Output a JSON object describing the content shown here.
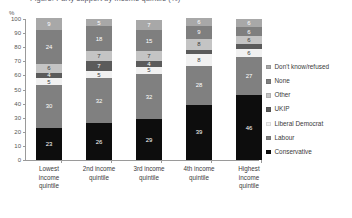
{
  "title_sliver": "Figure: Party support by income quintile (%)",
  "axis": {
    "y_unit_label": "%",
    "y_ticks": [
      0,
      10,
      20,
      30,
      40,
      50,
      60,
      70,
      80,
      90,
      100
    ]
  },
  "legend": {
    "position": "right",
    "items": [
      {
        "label": "Don't know/refused",
        "color": "#a8a8a8"
      },
      {
        "label": "None",
        "color": "#7f7f7f"
      },
      {
        "label": "Other",
        "color": "#c4c4c4"
      },
      {
        "label": "UKIP",
        "color": "#5b5b5b"
      },
      {
        "label": "Liberal Democrat",
        "color": "#f1f1f1"
      },
      {
        "label": "Labour",
        "color": "#808080"
      },
      {
        "label": "Conservative",
        "color": "#0d0d0d"
      }
    ]
  },
  "chart_data": {
    "type": "bar",
    "stacked": true,
    "title": "Figure: Party support by income quintile (%)",
    "xlabel": "",
    "ylabel": "%",
    "ylim": [
      0,
      100
    ],
    "grid": false,
    "legend_position": "right",
    "categories": [
      "Lowest income quintile",
      "2nd income quintile",
      "3rd income quintile",
      "4th income quintile",
      "Highest income quintile"
    ],
    "category_lines": [
      [
        "Lowest",
        "income",
        "quintile"
      ],
      [
        "2nd income",
        "quintile",
        ""
      ],
      [
        "3rd income",
        "quintile",
        ""
      ],
      [
        "4th income",
        "quintile",
        ""
      ],
      [
        "Highest",
        "income",
        "quintile"
      ]
    ],
    "stack_order_bottom_to_top": [
      "Conservative",
      "Labour",
      "Liberal Democrat",
      "UKIP",
      "Other",
      "None",
      "Don't know/refused"
    ],
    "series": [
      {
        "name": "Conservative",
        "color": "#0d0d0d",
        "label_color": "light",
        "values": [
          23,
          26,
          29,
          39,
          46
        ]
      },
      {
        "name": "Labour",
        "color": "#808080",
        "label_color": "light",
        "values": [
          30,
          32,
          32,
          28,
          27
        ]
      },
      {
        "name": "Liberal Democrat",
        "color": "#f1f1f1",
        "label_color": "dark",
        "values": [
          5,
          5,
          5,
          8,
          6
        ]
      },
      {
        "name": "UKIP",
        "color": "#5b5b5b",
        "label_color": "light",
        "values": [
          4,
          7,
          4,
          3,
          3
        ]
      },
      {
        "name": "Other",
        "color": "#c4c4c4",
        "label_color": "dark",
        "values": [
          6,
          7,
          7,
          8,
          6
        ]
      },
      {
        "name": "None",
        "color": "#7f7f7f",
        "label_color": "light",
        "values": [
          24,
          18,
          15,
          9,
          6
        ]
      },
      {
        "name": "Don't know/refused",
        "color": "#a8a8a8",
        "label_color": "light",
        "values": [
          9,
          5,
          7,
          6,
          6
        ]
      }
    ]
  }
}
